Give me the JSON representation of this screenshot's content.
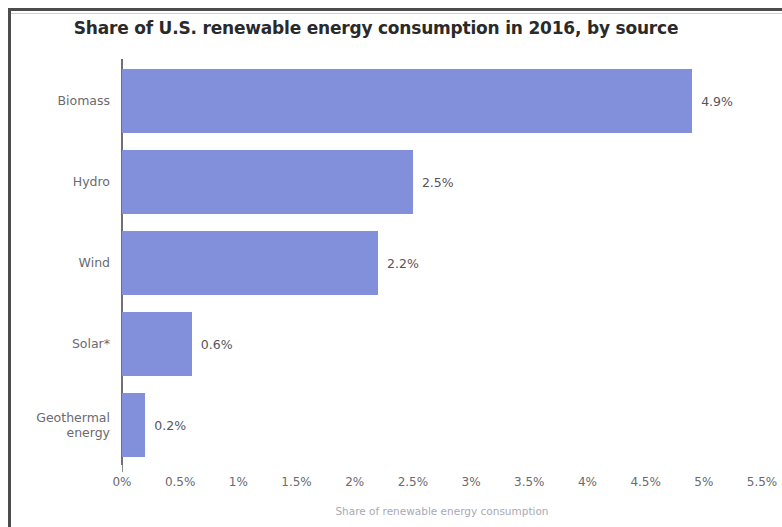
{
  "chart_data": {
    "type": "bar",
    "orientation": "horizontal",
    "title": "Share of U.S. renewable energy consumption in 2016, by source",
    "xlabel": "Share of renewable energy consumption",
    "ylabel": "",
    "categories": [
      "Biomass",
      "Hydro",
      "Wind",
      "Solar*",
      "Geothermal\nenergy"
    ],
    "values": [
      4.9,
      2.5,
      2.2,
      0.6,
      0.2
    ],
    "value_labels": [
      "4.9%",
      "2.5%",
      "2.2%",
      "0.6%",
      "0.2%"
    ],
    "xlim": [
      0,
      5.5
    ],
    "x_tick_values": [
      0,
      0.5,
      1,
      1.5,
      2,
      2.5,
      3,
      3.5,
      4,
      4.5,
      5,
      5.5
    ],
    "x_tick_labels": [
      "0%",
      "0.5%",
      "1%",
      "1.5%",
      "2%",
      "2.5%",
      "3%",
      "3.5%",
      "4%",
      "4.5%",
      "5%",
      "5.5%"
    ],
    "grid": false,
    "legend": false,
    "bar_color": "#8290DC",
    "title_color": "#2A2A2A",
    "label_color": "#6A6A70",
    "axis_color": "#6F6F74"
  }
}
